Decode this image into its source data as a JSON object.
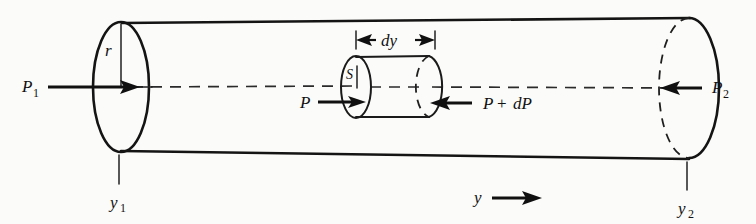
{
  "labels": {
    "pressure_left": "P",
    "pressure_left_sub": "1",
    "pressure_right": "P",
    "pressure_right_sub": "2",
    "pressure_element": "P",
    "pressure_element_plus": "P",
    "plus_sign": "+",
    "pressure_element_d": "dP",
    "radius": "r",
    "area": "S",
    "thickness": "dy",
    "position_left": "y",
    "position_left_sub": "1",
    "position_right": "y",
    "position_right_sub": "2",
    "axis": "y"
  },
  "colors": {
    "ink": "#141414",
    "background": "#fbfbf9",
    "hidden_line": "#1f1f1f"
  },
  "geometry": {
    "cylinder_left_x": 120,
    "cylinder_right_x": 688,
    "axis_y": 86,
    "end_cap_rx": 28,
    "end_cap_ry": 66,
    "element_left_x": 355,
    "element_right_x": 428,
    "element_rx": 15,
    "element_ry": 32
  }
}
